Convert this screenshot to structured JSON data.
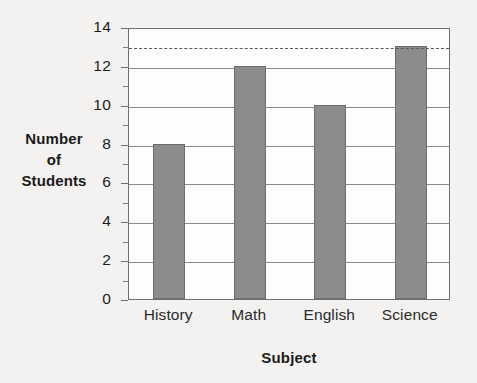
{
  "chart_data": {
    "type": "bar",
    "title": "",
    "subtitle": "",
    "categories": [
      "History",
      "Math",
      "English",
      "Science"
    ],
    "values": [
      8,
      12,
      10,
      13
    ],
    "xlabel": "Subject",
    "ylabel": "Number of Students",
    "ylabel_lines": [
      "Number",
      "of",
      "Students"
    ],
    "ylim": [
      0,
      14
    ],
    "ytick_labels": [
      "0",
      "2",
      "4",
      "6",
      "8",
      "10",
      "12",
      "14"
    ],
    "ytick_values": [
      0,
      2,
      4,
      6,
      8,
      10,
      12,
      14
    ],
    "yminor_tick_values": [
      1,
      3,
      5,
      7,
      9,
      11,
      13
    ],
    "grid": "horizontal-major-only",
    "legend": "none",
    "annotations": [
      {
        "name": "reference-line",
        "type": "horizontal-dashed-line",
        "value": 13,
        "label": ""
      }
    ],
    "colors": {
      "bar_fill": "#8c8c8c",
      "bar_stroke": "#6d6d6d",
      "gridline": "#8a8a8a",
      "axis": "#6f6f6f",
      "dashed_line": "#5a5a5a",
      "plot_background": "#fdfdfc",
      "page_background": "#f3f2f0",
      "text": "#1a1a1a"
    }
  }
}
